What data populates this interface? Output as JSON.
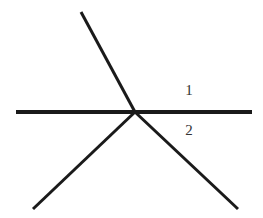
{
  "diagram": {
    "stroke_color": "#1a1a1a",
    "intersection": {
      "x": 135,
      "y": 112
    },
    "lines": [
      {
        "name": "horizontal-line",
        "x1": 16,
        "y1": 112,
        "x2": 252,
        "y2": 112,
        "width": 4
      },
      {
        "name": "upper-left-ray",
        "x1": 81,
        "y1": 12,
        "x2": 135,
        "y2": 112,
        "width": 3
      },
      {
        "name": "lower-left-ray",
        "x1": 33,
        "y1": 209,
        "x2": 135,
        "y2": 112,
        "width": 3
      },
      {
        "name": "lower-right-ray",
        "x1": 135,
        "y1": 112,
        "x2": 238,
        "y2": 209,
        "width": 3
      }
    ],
    "labels": [
      {
        "name": "angle-1-label",
        "text": "1",
        "x": 189,
        "y": 95
      },
      {
        "name": "angle-2-label",
        "text": "2",
        "x": 189,
        "y": 135
      }
    ]
  }
}
